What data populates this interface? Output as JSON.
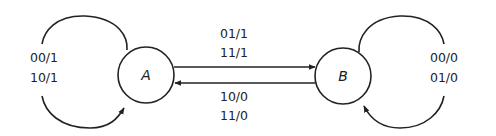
{
  "diagram": {
    "type": "state-diagram",
    "states": [
      {
        "id": "A",
        "label": "A"
      },
      {
        "id": "B",
        "label": "B"
      }
    ],
    "transitions": {
      "A_self": {
        "from": "A",
        "to": "A",
        "labels": [
          "00/1",
          "10/1"
        ]
      },
      "A_to_B": {
        "from": "A",
        "to": "B",
        "labels": [
          "01/1",
          "11/1"
        ]
      },
      "B_to_A": {
        "from": "B",
        "to": "A",
        "labels": [
          "10/0",
          "11/0"
        ]
      },
      "B_self": {
        "from": "B",
        "to": "B",
        "labels": [
          "00/0",
          "01/0"
        ]
      }
    }
  }
}
